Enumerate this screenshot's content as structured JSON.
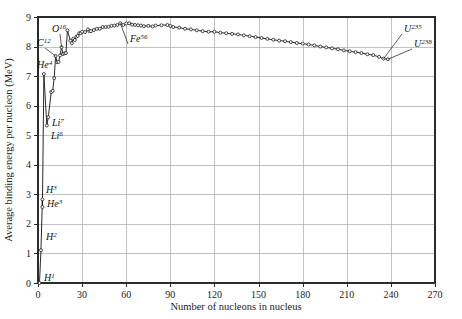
{
  "chart_data": {
    "type": "line",
    "title": "",
    "xlabel": "Number of nucleons in nucleus",
    "ylabel": "Average binding energy per nucleon (MeV)",
    "xlim": [
      0,
      270
    ],
    "ylim": [
      0,
      9
    ],
    "xticks": [
      0,
      30,
      60,
      90,
      120,
      150,
      180,
      210,
      240,
      270
    ],
    "yticks": [
      0,
      1,
      2,
      3,
      4,
      5,
      6,
      7,
      8,
      9
    ],
    "grid": true,
    "legend_position": "none",
    "marker": "open-circle",
    "line_color": "#111111",
    "grid_color": "#9a9a9a",
    "frame_color": "#2b2b2b",
    "series": [
      {
        "name": "Binding energy per nucleon",
        "x": [
          1,
          2,
          3,
          3,
          4,
          6,
          7,
          9,
          10,
          11,
          12,
          13,
          14,
          15,
          16,
          17,
          18,
          19,
          20,
          22,
          23,
          24,
          25,
          26,
          27,
          28,
          29,
          30,
          32,
          34,
          35,
          36,
          38,
          40,
          42,
          44,
          46,
          48,
          50,
          52,
          54,
          56,
          58,
          60,
          62,
          64,
          66,
          68,
          70,
          72,
          75,
          78,
          80,
          84,
          88,
          90,
          92,
          96,
          100,
          104,
          108,
          112,
          116,
          120,
          124,
          128,
          132,
          136,
          140,
          144,
          148,
          152,
          156,
          160,
          164,
          168,
          172,
          176,
          180,
          184,
          188,
          192,
          196,
          200,
          204,
          208,
          212,
          216,
          220,
          224,
          228,
          232,
          235,
          238
        ],
        "y": [
          0.0,
          1.11,
          2.83,
          2.57,
          7.07,
          5.33,
          5.61,
          6.46,
          6.5,
          6.93,
          7.68,
          7.47,
          7.48,
          7.7,
          7.98,
          7.75,
          7.77,
          7.78,
          8.55,
          8.2,
          8.11,
          8.26,
          8.22,
          8.33,
          8.36,
          8.45,
          8.45,
          8.5,
          8.49,
          8.58,
          8.52,
          8.52,
          8.56,
          8.6,
          8.6,
          8.66,
          8.66,
          8.67,
          8.7,
          8.71,
          8.73,
          8.79,
          8.73,
          8.78,
          8.79,
          8.74,
          8.73,
          8.72,
          8.71,
          8.69,
          8.7,
          8.68,
          8.71,
          8.72,
          8.73,
          8.7,
          8.66,
          8.64,
          8.6,
          8.58,
          8.55,
          8.52,
          8.5,
          8.5,
          8.47,
          8.45,
          8.43,
          8.41,
          8.38,
          8.35,
          8.32,
          8.29,
          8.26,
          8.23,
          8.2,
          8.18,
          8.15,
          8.12,
          8.1,
          8.07,
          8.04,
          8.0,
          7.97,
          7.94,
          7.91,
          7.87,
          7.84,
          7.81,
          7.78,
          7.74,
          7.71,
          7.65,
          7.59,
          7.57
        ]
      }
    ],
    "annotations": [
      {
        "name": "H1",
        "symbol": "H",
        "mass": "1",
        "x": 1,
        "y": 0.0,
        "label_x": 44,
        "label_y": 281,
        "leader": false
      },
      {
        "name": "H2",
        "symbol": "H",
        "mass": "2",
        "x": 2,
        "y": 1.11,
        "label_x": 46,
        "label_y": 240,
        "leader": false
      },
      {
        "name": "He3",
        "symbol": "He",
        "mass": "3",
        "x": 3,
        "y": 2.57,
        "label_x": 47,
        "label_y": 207,
        "leader": false
      },
      {
        "name": "H3",
        "symbol": "H",
        "mass": "3",
        "x": 3,
        "y": 2.83,
        "label_x": 46,
        "label_y": 193,
        "leader": false
      },
      {
        "name": "Li6",
        "symbol": "Li",
        "mass": "6",
        "x": 6,
        "y": 5.33,
        "label_x": 51,
        "label_y": 139,
        "leader": false
      },
      {
        "name": "Li7",
        "symbol": "Li",
        "mass": "7",
        "x": 7,
        "y": 5.61,
        "label_x": 52,
        "label_y": 126,
        "leader": false
      },
      {
        "name": "He4",
        "symbol": "He",
        "mass": "4",
        "x": 4,
        "y": 7.07,
        "label_x": 37,
        "label_y": 68,
        "leader": false
      },
      {
        "name": "C12",
        "symbol": "C",
        "mass": "12",
        "x": 12,
        "y": 7.68,
        "label_x": 37,
        "label_y": 46,
        "leader": true
      },
      {
        "name": "O16",
        "symbol": "O",
        "mass": "16",
        "x": 16,
        "y": 7.98,
        "label_x": 52,
        "label_y": 32,
        "leader": true
      },
      {
        "name": "Fe56",
        "symbol": "Fe",
        "mass": "56",
        "x": 56,
        "y": 8.79,
        "label_x": 130,
        "label_y": 42,
        "leader": true
      },
      {
        "name": "U235",
        "symbol": "U",
        "mass": "235",
        "x": 235,
        "y": 7.59,
        "label_x": 404,
        "label_y": 32,
        "leader": true
      },
      {
        "name": "U238",
        "symbol": "U",
        "mass": "238",
        "x": 238,
        "y": 7.57,
        "label_x": 414,
        "label_y": 47,
        "leader": true
      }
    ]
  },
  "figure": {
    "plot_left": 38,
    "plot_right": 435,
    "plot_top": 17,
    "plot_bottom": 283
  }
}
